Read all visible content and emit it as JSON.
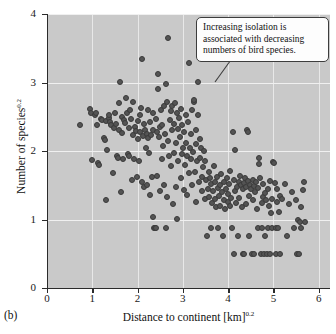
{
  "figure": {
    "panel_letter": "(b)",
    "background_color": "#c9c9c9",
    "point_color": "#545454"
  },
  "callout": {
    "text": "Increasing isolation is associated with decreasing numbers of bird species."
  },
  "chart_data": {
    "type": "scatter",
    "title": "",
    "xlabel": "Distance to continent [km]",
    "xlabel_exponent": "0.2",
    "ylabel": "Number of species",
    "ylabel_exponent": "0.2",
    "xlim": [
      0,
      6.25
    ],
    "ylim": [
      0,
      4
    ],
    "xticks": [
      0,
      1,
      2,
      3,
      4,
      5,
      6
    ],
    "yticks": [
      0,
      1,
      2,
      3,
      4
    ],
    "grid": true,
    "grid_color": "#eeeeee",
    "legend": null,
    "annotations": [
      {
        "text": "Increasing isolation is associated with decreasing numbers of bird species.",
        "anchor_x": 3.35,
        "anchor_y": 2.78
      }
    ],
    "points": [
      [
        0.72,
        2.38
      ],
      [
        0.95,
        2.61
      ],
      [
        0.97,
        2.55
      ],
      [
        0.99,
        1.87
      ],
      [
        1.05,
        2.52
      ],
      [
        1.08,
        2.56
      ],
      [
        1.1,
        2.38
      ],
      [
        1.12,
        1.82
      ],
      [
        1.14,
        1.8
      ],
      [
        1.2,
        2.46
      ],
      [
        1.22,
        2.45
      ],
      [
        1.25,
        2.19
      ],
      [
        1.27,
        2.16
      ],
      [
        1.3,
        2.44
      ],
      [
        1.31,
        1.29
      ],
      [
        1.33,
        2.02
      ],
      [
        1.36,
        2.48
      ],
      [
        1.38,
        2.52
      ],
      [
        1.4,
        2.43
      ],
      [
        1.42,
        2.38
      ],
      [
        1.45,
        1.68
      ],
      [
        1.47,
        2.34
      ],
      [
        1.5,
        2.55
      ],
      [
        1.52,
        2.4
      ],
      [
        1.54,
        1.93
      ],
      [
        1.56,
        1.9
      ],
      [
        1.58,
        2.3
      ],
      [
        1.6,
        2.7
      ],
      [
        1.62,
        3.01
      ],
      [
        1.63,
        1.4
      ],
      [
        1.65,
        2.5
      ],
      [
        1.66,
        2.26
      ],
      [
        1.68,
        1.88
      ],
      [
        1.7,
        2.45
      ],
      [
        1.72,
        2.41
      ],
      [
        1.74,
        2.77
      ],
      [
        1.76,
        2.55
      ],
      [
        1.78,
        1.95
      ],
      [
        1.8,
        1.92
      ],
      [
        1.82,
        2.33
      ],
      [
        1.84,
        2.6
      ],
      [
        1.85,
        2.47
      ],
      [
        1.87,
        1.58
      ],
      [
        1.89,
        2.24
      ],
      [
        1.9,
        2.71
      ],
      [
        1.92,
        1.89
      ],
      [
        1.94,
        2.35
      ],
      [
        1.96,
        2.29
      ],
      [
        1.98,
        1.62
      ],
      [
        2.0,
        2.44
      ],
      [
        2.01,
        2.18
      ],
      [
        2.03,
        1.85
      ],
      [
        2.05,
        2.52
      ],
      [
        2.06,
        2.28
      ],
      [
        2.08,
        2.63
      ],
      [
        2.09,
        1.55
      ],
      [
        2.1,
        3.35
      ],
      [
        2.12,
        2.22
      ],
      [
        2.14,
        2.4
      ],
      [
        2.15,
        1.47
      ],
      [
        2.17,
        2.3
      ],
      [
        2.18,
        2.05
      ],
      [
        2.2,
        2.25
      ],
      [
        2.21,
        1.5
      ],
      [
        2.23,
        2.6
      ],
      [
        2.24,
        2.19
      ],
      [
        2.26,
        1.97
      ],
      [
        2.27,
        1.36
      ],
      [
        2.28,
        2.42
      ],
      [
        2.3,
        2.24
      ],
      [
        2.31,
        1.62
      ],
      [
        2.33,
        2.56
      ],
      [
        2.34,
        1.04
      ],
      [
        2.35,
        2.31
      ],
      [
        2.36,
        0.87
      ],
      [
        2.38,
        0.87
      ],
      [
        2.4,
        0.87
      ],
      [
        2.41,
        2.47
      ],
      [
        2.42,
        2.28
      ],
      [
        2.44,
        1.63
      ],
      [
        2.45,
        2.9
      ],
      [
        2.46,
        3.12
      ],
      [
        2.48,
        2.2
      ],
      [
        2.49,
        1.42
      ],
      [
        2.5,
        2.35
      ],
      [
        2.52,
        2.6
      ],
      [
        2.53,
        1.88
      ],
      [
        2.55,
        2.38
      ],
      [
        2.56,
        2.07
      ],
      [
        2.58,
        1.51
      ],
      [
        2.59,
        2.65
      ],
      [
        2.6,
        2.25
      ],
      [
        2.62,
        0.87
      ],
      [
        2.63,
        2.98
      ],
      [
        2.64,
        1.33
      ],
      [
        2.66,
        2.72
      ],
      [
        2.67,
        3.65
      ],
      [
        2.68,
        2.15
      ],
      [
        2.7,
        1.93
      ],
      [
        2.71,
        2.45
      ],
      [
        2.73,
        2.58
      ],
      [
        2.74,
        1.78
      ],
      [
        2.75,
        2.3
      ],
      [
        2.77,
        2.66
      ],
      [
        2.78,
        1.22
      ],
      [
        2.8,
        2.4
      ],
      [
        2.81,
        1.97
      ],
      [
        2.82,
        2.7
      ],
      [
        2.84,
        1.47
      ],
      [
        2.85,
        2.12
      ],
      [
        2.86,
        2.55
      ],
      [
        2.88,
        1.01
      ],
      [
        2.89,
        2.32
      ],
      [
        2.9,
        1.86
      ],
      [
        2.92,
        2.48
      ],
      [
        2.93,
        2.2
      ],
      [
        2.95,
        1.6
      ],
      [
        2.96,
        2.62
      ],
      [
        2.98,
        1.95
      ],
      [
        2.99,
        2.38
      ],
      [
        3.0,
        2.05
      ],
      [
        3.02,
        1.43
      ],
      [
        3.03,
        2.28
      ],
      [
        3.05,
        1.79
      ],
      [
        3.06,
        2.53
      ],
      [
        3.08,
        2.12
      ],
      [
        3.09,
        1.36
      ],
      [
        3.1,
        1.93
      ],
      [
        3.12,
        2.42
      ],
      [
        3.13,
        1.68
      ],
      [
        3.14,
        3.28
      ],
      [
        3.16,
        2.05
      ],
      [
        3.17,
        1.88
      ],
      [
        3.18,
        2.25
      ],
      [
        3.2,
        1.5
      ],
      [
        3.21,
        2.6
      ],
      [
        3.22,
        1.98
      ],
      [
        3.24,
        2.71
      ],
      [
        3.25,
        2.74
      ],
      [
        3.26,
        1.7
      ],
      [
        3.28,
        2.1
      ],
      [
        3.29,
        1.26
      ],
      [
        3.3,
        2.3
      ],
      [
        3.31,
        1.85
      ],
      [
        3.33,
        3.01
      ],
      [
        3.34,
        2.52
      ],
      [
        3.36,
        1.55
      ],
      [
        3.37,
        2.18
      ],
      [
        3.38,
        1.9
      ],
      [
        3.4,
        2.05
      ],
      [
        3.42,
        1.62
      ],
      [
        3.43,
        1.41
      ],
      [
        3.45,
        1.76
      ],
      [
        3.46,
        2.0
      ],
      [
        3.48,
        1.3
      ],
      [
        3.5,
        1.85
      ],
      [
        3.52,
        1.58
      ],
      [
        3.53,
        0.76
      ],
      [
        3.55,
        1.45
      ],
      [
        3.57,
        1.7
      ],
      [
        3.58,
        1.33
      ],
      [
        3.6,
        1.6
      ],
      [
        3.62,
        0.87
      ],
      [
        3.63,
        1.52
      ],
      [
        3.65,
        1.24
      ],
      [
        3.67,
        1.42
      ],
      [
        3.68,
        1.78
      ],
      [
        3.7,
        1.55
      ],
      [
        3.72,
        1.3
      ],
      [
        3.73,
        1.18
      ],
      [
        3.75,
        1.62
      ],
      [
        3.77,
        1.46
      ],
      [
        3.78,
        0.87
      ],
      [
        3.8,
        1.35
      ],
      [
        3.82,
        1.5
      ],
      [
        3.83,
        1.2
      ],
      [
        3.85,
        1.66
      ],
      [
        3.87,
        1.4
      ],
      [
        3.88,
        0.76
      ],
      [
        3.9,
        1.28
      ],
      [
        3.92,
        1.55
      ],
      [
        3.94,
        1.15
      ],
      [
        3.95,
        1.44
      ],
      [
        3.97,
        1.6
      ],
      [
        3.99,
        1.25
      ],
      [
        4.0,
        1.37
      ],
      [
        4.02,
        1.52
      ],
      [
        4.04,
        1.19
      ],
      [
        4.05,
        1.71
      ],
      [
        4.07,
        1.31
      ],
      [
        4.09,
        0.87
      ],
      [
        4.1,
        2.28
      ],
      [
        4.12,
        1.58
      ],
      [
        4.13,
        0.5
      ],
      [
        4.15,
        1.42
      ],
      [
        4.16,
        2.02
      ],
      [
        4.18,
        1.24
      ],
      [
        4.2,
        1.48
      ],
      [
        4.22,
        0.76
      ],
      [
        4.24,
        1.55
      ],
      [
        4.25,
        1.32
      ],
      [
        4.27,
        1.63
      ],
      [
        4.29,
        1.5
      ],
      [
        4.3,
        1.18
      ],
      [
        4.32,
        1.45
      ],
      [
        4.33,
        0.5
      ],
      [
        4.35,
        1.53
      ],
      [
        4.36,
        0.5
      ],
      [
        4.38,
        1.6
      ],
      [
        4.39,
        1.22
      ],
      [
        4.4,
        1.48
      ],
      [
        4.42,
        2.31
      ],
      [
        4.43,
        1.56
      ],
      [
        4.45,
        2.28
      ],
      [
        4.46,
        1.35
      ],
      [
        4.47,
        0.76
      ],
      [
        4.49,
        1.5
      ],
      [
        4.5,
        1.44
      ],
      [
        4.52,
        0.5
      ],
      [
        4.54,
        1.58
      ],
      [
        4.55,
        1.28
      ],
      [
        4.57,
        1.49
      ],
      [
        4.58,
        0.5
      ],
      [
        4.6,
        1.4
      ],
      [
        4.62,
        1.55
      ],
      [
        4.63,
        1.16
      ],
      [
        4.65,
        0.87
      ],
      [
        4.66,
        1.46
      ],
      [
        4.68,
        1.81
      ],
      [
        4.69,
        1.9
      ],
      [
        4.7,
        1.6
      ],
      [
        4.72,
        0.5
      ],
      [
        4.74,
        1.24
      ],
      [
        4.75,
        0.87
      ],
      [
        4.76,
        1.33
      ],
      [
        4.78,
        1.52
      ],
      [
        4.79,
        0.5
      ],
      [
        4.81,
        1.38
      ],
      [
        4.82,
        0.76
      ],
      [
        4.84,
        1.28
      ],
      [
        4.85,
        0.5
      ],
      [
        4.87,
        1.45
      ],
      [
        4.88,
        0.87
      ],
      [
        4.9,
        1.2
      ],
      [
        4.92,
        1.56
      ],
      [
        4.93,
        0.5
      ],
      [
        4.95,
        1.09
      ],
      [
        4.96,
        0.87
      ],
      [
        4.98,
        1.3
      ],
      [
        5.0,
        1.84
      ],
      [
        5.01,
        1.82
      ],
      [
        5.03,
        1.53
      ],
      [
        5.05,
        0.5
      ],
      [
        5.06,
        0.87
      ],
      [
        5.08,
        1.25
      ],
      [
        5.09,
        1.44
      ],
      [
        5.1,
        0.87
      ],
      [
        5.12,
        1.11
      ],
      [
        5.14,
        0.5
      ],
      [
        5.15,
        1.35
      ],
      [
        5.2,
        1.3
      ],
      [
        5.25,
        1.52
      ],
      [
        5.3,
        0.76
      ],
      [
        5.35,
        1.22
      ],
      [
        5.4,
        1.4
      ],
      [
        5.45,
        0.87
      ],
      [
        5.5,
        1.28
      ],
      [
        5.52,
        0.5
      ],
      [
        5.55,
        1.0
      ],
      [
        5.57,
        0.5
      ],
      [
        5.58,
        0.96
      ],
      [
        5.6,
        1.18
      ],
      [
        5.62,
        0.87
      ],
      [
        5.65,
        1.43
      ],
      [
        5.68,
        1.55
      ],
      [
        5.7,
        0.96
      ]
    ]
  }
}
